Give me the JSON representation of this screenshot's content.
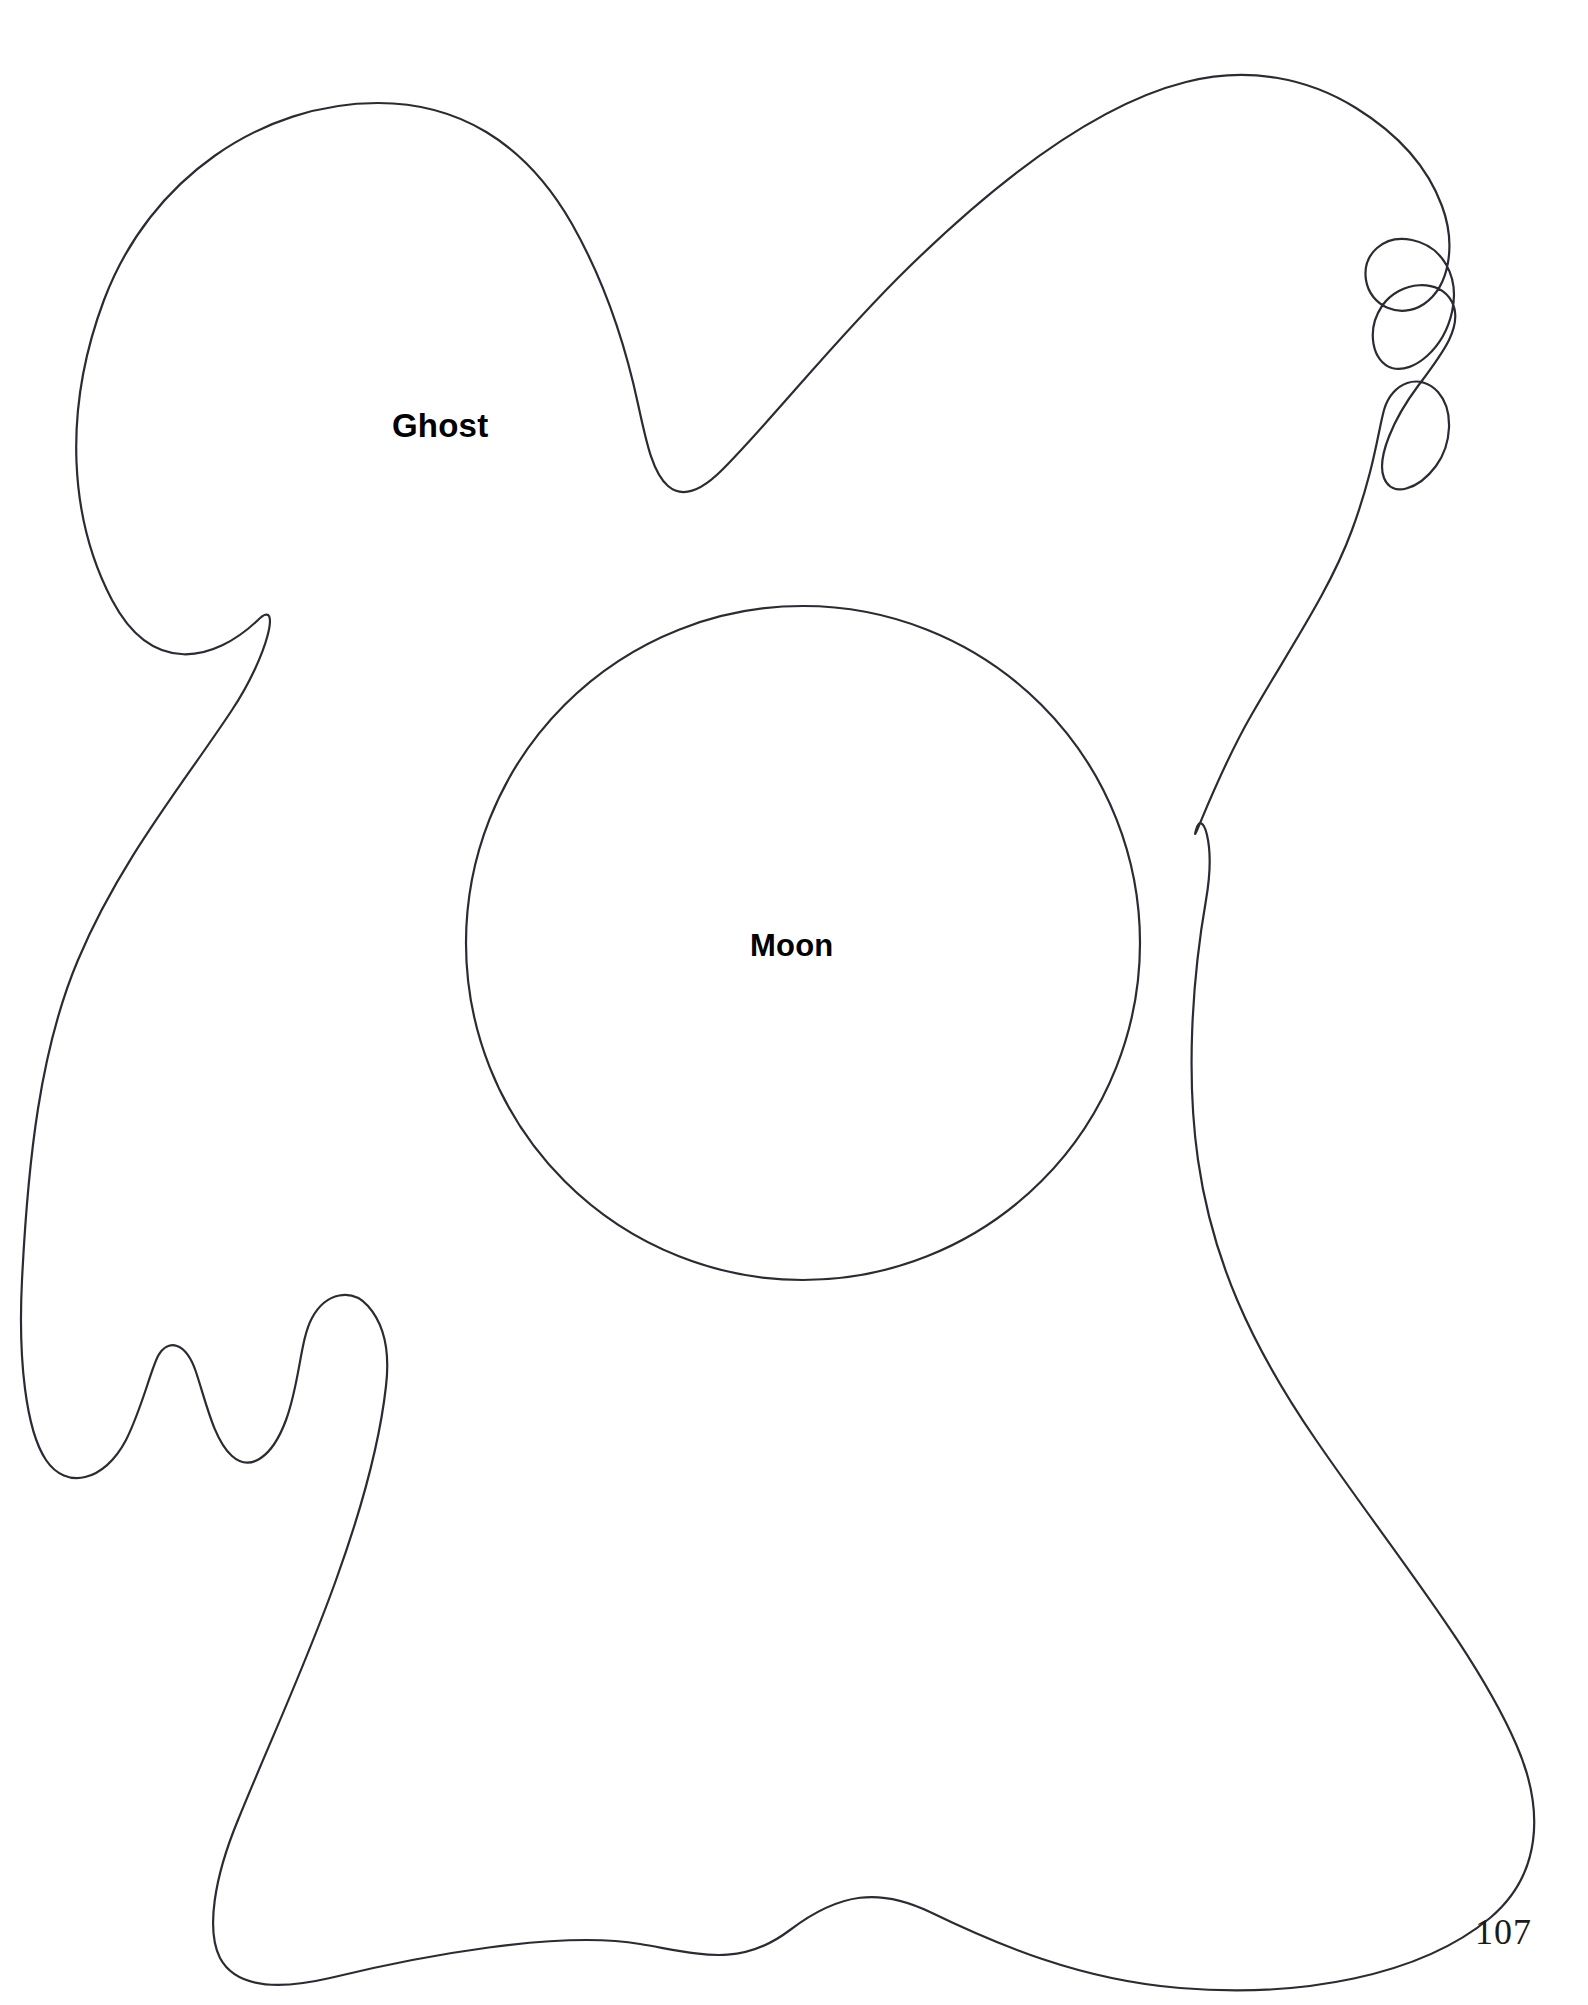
{
  "page": {
    "background_color": "#ffffff",
    "ink_color": "#2b2b33",
    "text_color": "#000000",
    "page_number": "107",
    "width": 1588,
    "height": 2005
  },
  "pattern": {
    "title": "Ghost pattern template",
    "pieces": [
      {
        "id": "ghost",
        "label": "Ghost",
        "shape": "ghost-body-outline",
        "label_position": {
          "x": 392,
          "y": 407
        }
      },
      {
        "id": "moon",
        "label": "Moon",
        "shape": "circle",
        "center": {
          "x": 803,
          "y": 943
        },
        "radius": 337,
        "label_position": {
          "x": 750,
          "y": 928
        }
      }
    ]
  },
  "geometry": {
    "ghost_outline_path": "M 378 103 C 262 103 150 178 104 300 C 62 412 70 520 112 600 C 152 676 214 662 258 620 C 282 596 268 656 232 710 C 186 780 120 860 78 960 C 40 1050 28 1160 22 1280 C 18 1360 26 1430 46 1460 C 66 1490 104 1482 126 1440 C 142 1408 150 1372 158 1356 C 168 1338 186 1342 196 1372 C 206 1402 214 1440 232 1456 C 250 1472 272 1458 286 1420 C 300 1382 300 1340 312 1318 C 326 1292 352 1288 368 1306 C 384 1324 390 1352 386 1386 C 380 1440 362 1508 336 1580 C 306 1664 268 1746 238 1820 C 214 1878 206 1930 220 1958 C 236 1988 278 1990 330 1978 C 420 1956 560 1930 640 1944 C 700 1954 740 1968 790 1930 C 840 1892 880 1888 930 1912 C 996 1944 1080 1980 1180 1988 C 1300 1998 1420 1976 1490 1918 C 1540 1876 1546 1812 1516 1744 C 1476 1652 1390 1548 1316 1440 C 1250 1344 1212 1258 1198 1160 C 1186 1076 1192 980 1206 900 C 1216 842 1202 808 1196 830 C 1190 852 1216 776 1252 714 C 1290 648 1330 590 1352 530 C 1374 470 1378 432 1384 410 C 1392 382 1420 372 1438 392 C 1454 410 1452 444 1436 466 C 1418 490 1392 498 1384 478 C 1376 458 1394 418 1418 386 C 1442 354 1464 326 1452 302 C 1440 278 1400 280 1382 306 C 1366 330 1372 362 1392 368 C 1414 374 1444 348 1452 312 C 1460 276 1442 246 1412 240 C 1384 234 1362 254 1366 280 C 1370 306 1400 320 1424 304 C 1450 286 1456 244 1442 206 C 1428 168 1398 134 1356 108 C 1308 78 1248 66 1186 82 C 1098 104 1000 178 908 268 C 836 338 772 420 722 470 C 700 492 682 498 668 486 C 652 472 646 440 638 404 C 626 348 606 284 572 224 C 524 140 456 103 378 103 Z",
    "moon_circle": {
      "cx": 803,
      "cy": 943,
      "r": 337
    }
  },
  "labels": {
    "ghost": "Ghost",
    "moon": "Moon",
    "page_number": "107"
  }
}
